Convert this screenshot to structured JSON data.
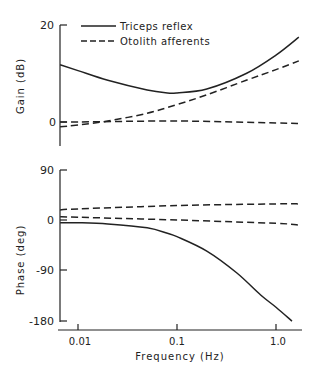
{
  "chart_data": [
    {
      "type": "line",
      "panel": "gain",
      "ylabel": "Gain (dB)",
      "xlabel": "",
      "xscale": "log",
      "xlim": [
        0.0066,
        1.7
      ],
      "ylim": [
        -4,
        20
      ],
      "yticks": [
        0,
        20
      ],
      "ytick_labels": [
        "0",
        "20"
      ],
      "legend": [
        "Triceps reflex",
        "Otolith afferents"
      ],
      "legend_position": "upper left",
      "series": [
        {
          "name": "Triceps reflex",
          "style": "solid",
          "x": [
            0.0066,
            0.01,
            0.02,
            0.05,
            0.08,
            0.1,
            0.2,
            0.5,
            1.0,
            1.7
          ],
          "values": [
            11.8,
            10.6,
            8.6,
            6.6,
            6.0,
            6.0,
            6.8,
            10.0,
            13.8,
            17.5
          ]
        },
        {
          "name": "Otolith afferents",
          "style": "dashed",
          "x": [
            0.0066,
            0.01,
            0.02,
            0.05,
            0.1,
            0.2,
            0.5,
            1.0,
            1.7
          ],
          "values": [
            -1.0,
            -0.6,
            0.2,
            1.8,
            3.6,
            5.6,
            8.6,
            10.8,
            12.6
          ]
        },
        {
          "name": "Otolith afferents",
          "style": "dashed",
          "x": [
            0.0066,
            0.01,
            0.1,
            1.0,
            1.7
          ],
          "values": [
            0.0,
            0.0,
            0.2,
            -0.2,
            -0.3
          ]
        }
      ]
    },
    {
      "type": "line",
      "panel": "phase",
      "ylabel": "Phase (deg)",
      "xlabel": "Frequency (Hz)",
      "xscale": "log",
      "xlim": [
        0.0066,
        1.7
      ],
      "ylim": [
        -180,
        90
      ],
      "yticks": [
        90,
        0,
        -90,
        -180
      ],
      "ytick_labels": [
        "90",
        "0",
        "-90",
        "-180"
      ],
      "xticks": [
        0.01,
        0.1,
        1.0
      ],
      "xtick_labels": [
        "0.01",
        "0.1",
        "1.0"
      ],
      "series": [
        {
          "name": "Triceps reflex",
          "style": "solid",
          "x": [
            0.0066,
            0.01,
            0.02,
            0.05,
            0.08,
            0.1,
            0.2,
            0.4,
            0.7,
            1.0,
            1.45
          ],
          "values": [
            -5,
            -5,
            -7,
            -14,
            -24,
            -30,
            -56,
            -95,
            -135,
            -157,
            -182
          ]
        },
        {
          "name": "Otolith afferents",
          "style": "dashed",
          "x": [
            0.0066,
            0.01,
            0.1,
            1.0,
            1.7
          ],
          "values": [
            18,
            20,
            26,
            29,
            29
          ]
        },
        {
          "name": "Otolith afferents",
          "style": "dashed",
          "x": [
            0.0066,
            0.01,
            0.1,
            1.0,
            1.7
          ],
          "values": [
            6,
            5,
            0,
            -6,
            -9
          ]
        }
      ]
    }
  ],
  "labels": {
    "gain_ylabel": "Gain (dB)",
    "phase_ylabel": "Phase (deg)",
    "xlabel": "Frequency (Hz)",
    "legend_solid": "Triceps reflex",
    "legend_dashed": "Otolith afferents",
    "gain_ticks": [
      "20",
      "0"
    ],
    "phase_ticks": [
      "90",
      "0",
      "-90",
      "-180"
    ],
    "x_ticks": [
      "0.01",
      "0.1",
      "1.0"
    ]
  }
}
